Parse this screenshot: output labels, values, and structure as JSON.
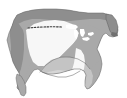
{
  "figure": {
    "name": "north-america-shaded-zone-map",
    "kind": "thematic-map",
    "width": 127,
    "height": 98,
    "background_color": "#ffffff",
    "alt_text": "Grayscale thematic map of North America showing shaded zones across the United States, southern Canada and northern Mexico, with a dotted line across the northern plains"
  },
  "colors": {
    "background": "#ffffff",
    "ocean": "#ffffff",
    "zone_dark": "#8e8e8e",
    "zone_mid": "#a9a9a9",
    "zone_light": "#c4c4c4",
    "zone_pale": "#d6d6d6",
    "zone_white": "#f7f7f7",
    "lakes": "#ffffff",
    "outline": "#6b6b6b",
    "dotted_line": "#3c3c3c"
  },
  "regions": [
    {
      "id": "canada-north-band",
      "label": "Northern band",
      "fill": "#8e8e8e"
    },
    {
      "id": "western-cordillera",
      "label": "Western mountains",
      "fill": "#8e8e8e"
    },
    {
      "id": "great-basin",
      "label": "Interior west",
      "fill": "#a9a9a9"
    },
    {
      "id": "central-plains-white",
      "label": "Central plains",
      "fill": "#f7f7f7"
    },
    {
      "id": "eastern-midgray",
      "label": "Eastern zone",
      "fill": "#a9a9a9"
    },
    {
      "id": "southeast-light",
      "label": "Southeast zone",
      "fill": "#c4c4c4"
    },
    {
      "id": "gulf-coast-pale",
      "label": "Gulf coast zone",
      "fill": "#d6d6d6"
    },
    {
      "id": "florida-peninsula",
      "label": "Florida",
      "fill": "#c4c4c4"
    },
    {
      "id": "baja-peninsula",
      "label": "Baja California",
      "fill": "#a9a9a9"
    },
    {
      "id": "great-lakes",
      "label": "Great Lakes",
      "fill": "#ffffff"
    }
  ],
  "annotations": {
    "dotted_line": {
      "id": "northern-plains-dotted-line",
      "label": "Dotted boundary line",
      "color": "#3c3c3c",
      "dash_pattern": "1.6 1.6",
      "stroke_width": 1.1,
      "start": [
        28,
        28
      ],
      "end": [
        63,
        27
      ]
    }
  }
}
